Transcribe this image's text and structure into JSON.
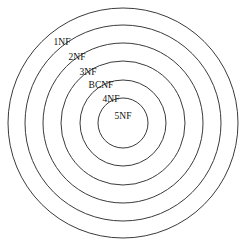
{
  "diagram": {
    "background_color": "#ffffff",
    "stroke_color": "#3b3b3b",
    "text_color": "#111111",
    "center": {
      "x": 123,
      "y": 123
    },
    "rings": [
      {
        "label": "1NF",
        "radius": 115,
        "label_x": 62,
        "label_y": 43,
        "anchor": "middle"
      },
      {
        "label": "2NF",
        "radius": 98,
        "label_x": 77,
        "label_y": 58,
        "anchor": "middle"
      },
      {
        "label": "3NF",
        "radius": 80,
        "label_x": 88,
        "label_y": 73,
        "anchor": "middle"
      },
      {
        "label": "BCNF",
        "radius": 62,
        "label_x": 101,
        "label_y": 86,
        "anchor": "middle"
      },
      {
        "label": "4NF",
        "radius": 43,
        "label_x": 111,
        "label_y": 100,
        "anchor": "middle"
      },
      {
        "label": "5NF",
        "radius": 25,
        "label_x": 123,
        "label_y": 117,
        "anchor": "middle"
      }
    ]
  }
}
